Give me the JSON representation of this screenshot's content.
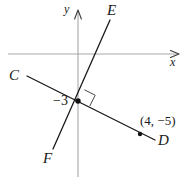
{
  "figure": {
    "width": 191,
    "height": 177,
    "background_color": "#ffffff",
    "axis_color": "#a8a8a8",
    "line_color": "#1a1a1a",
    "label_color": "#1a1a1a"
  },
  "axes": {
    "x_axis_label": "x",
    "y_axis_label": "y",
    "origin_px": {
      "x": 78,
      "y": 54
    },
    "x_axis_arrow": true,
    "y_axis_arrow": true
  },
  "lines": [
    {
      "name": "line-CD",
      "start_label": "C",
      "end_label": "D",
      "description": "Line through C (upper left) and D (lower right), passing through (0,-3) and (4,-5)",
      "slope": -0.5
    },
    {
      "name": "line-EF",
      "start_label": "E",
      "end_label": "F",
      "description": "Line through E (upper right) and F (lower left), perpendicular to CD at (0,-3)",
      "slope": 2
    }
  ],
  "labels": {
    "point_C": "C",
    "point_D": "D",
    "point_E": "E",
    "point_F": "F",
    "y_intercept_value": "−3",
    "point_coordinate": "(4, −5)"
  },
  "markers": {
    "intersection_point": {
      "x": 78,
      "y": 101,
      "filled": true
    },
    "coordinate_point": {
      "x": 140,
      "y": 134,
      "filled": true
    },
    "right_angle_marker": true
  }
}
